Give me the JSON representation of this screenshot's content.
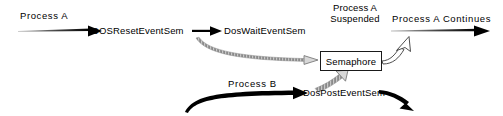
{
  "diagram": {
    "background_color": "#ffffff",
    "ink_color": "#000000",
    "accent_gray": "#8a8a8a",
    "labels": {
      "process_a": "Process A",
      "dos_reset_event_sem": "DOSResetEventSem",
      "dos_wait_event_sem": "DosWaitEventSem",
      "process_a_suspended_line1": "Process A",
      "process_a_suspended_line2": "Suspended",
      "process_a_continues": "Process A Continues",
      "semaphore": "Semaphore",
      "process_b": "Process B",
      "dos_post_event_sem": "DosPostEventSem"
    },
    "edges": [
      {
        "name": "process-a-entry-arrow",
        "style": "solid-black-tapered",
        "from": "Process A",
        "to": "DOSResetEventSem"
      },
      {
        "name": "reset-to-wait-arrow",
        "style": "solid-black",
        "from": "DOSResetEventSem",
        "to": "DosWaitEventSem"
      },
      {
        "name": "wait-to-semaphore-arrow",
        "style": "gray-hatched-curve",
        "from": "DosWaitEventSem",
        "to": "Semaphore"
      },
      {
        "name": "semaphore-to-continue-arrow",
        "style": "hollow-outline-curve",
        "from": "Semaphore",
        "to": "Process A Continues"
      },
      {
        "name": "process-a-continues-arrow",
        "style": "solid-black-tapered",
        "from": "Process A Suspended",
        "to": "Process A Continues"
      },
      {
        "name": "process-b-entry-arrow",
        "style": "solid-black-thick-curve",
        "from": "Process B",
        "to": "DosPostEventSem"
      },
      {
        "name": "post-to-semaphore-arrow",
        "style": "gray-hatched-curve",
        "from": "DosPostEventSem",
        "to": "Semaphore"
      },
      {
        "name": "post-continues-arrow",
        "style": "solid-black-curve",
        "from": "DosPostEventSem",
        "to": "continues-off-diagram"
      }
    ]
  }
}
